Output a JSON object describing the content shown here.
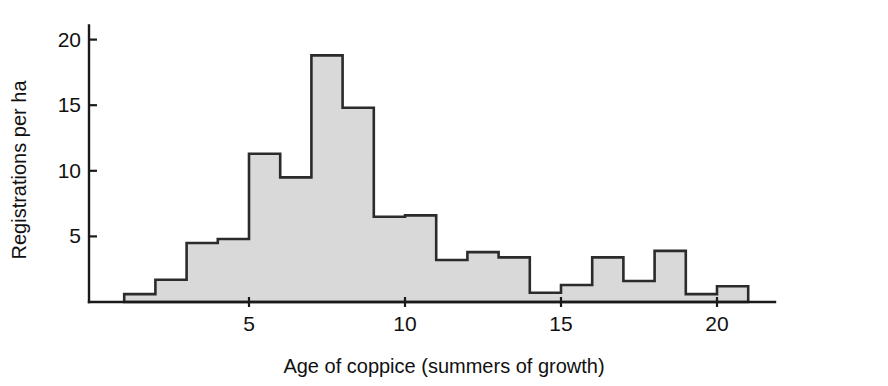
{
  "figure": {
    "background_color": "#ffffff",
    "width": 888,
    "height": 386
  },
  "chart_data": {
    "type": "bar",
    "subtype": "histogram",
    "title": "",
    "subtitle": "",
    "xlabel": "Age of coppice (summers of growth)",
    "ylabel": "Registrations per ha",
    "xlim": [
      0,
      22
    ],
    "ylim": [
      0,
      21
    ],
    "xticks": [
      5,
      10,
      15,
      20
    ],
    "yticks": [
      5,
      10,
      15,
      20
    ],
    "xtick_labels": [
      "5",
      "10",
      "15",
      "20"
    ],
    "ytick_labels": [
      "5",
      "10",
      "15",
      "20"
    ],
    "grid": false,
    "legend": false,
    "legend_position": "none",
    "bin_width": 1,
    "bin_starts": [
      1,
      2,
      3,
      4,
      5,
      6,
      7,
      8,
      9,
      10,
      11,
      12,
      13,
      14,
      15,
      16,
      17,
      18,
      19,
      20
    ],
    "categories": [
      "1-2",
      "2-3",
      "3-4",
      "4-5",
      "5-6",
      "6-7",
      "7-8",
      "8-9",
      "9-10",
      "10-11",
      "11-12",
      "12-13",
      "13-14",
      "14-15",
      "15-16",
      "16-17",
      "17-18",
      "18-19",
      "19-20",
      "20-21"
    ],
    "values": [
      0.6,
      1.7,
      4.5,
      4.8,
      11.3,
      9.5,
      18.8,
      14.8,
      6.5,
      6.6,
      3.2,
      3.8,
      3.4,
      0.7,
      1.3,
      3.4,
      1.6,
      3.9,
      0.6,
      1.2
    ],
    "bar_fill_color": "#d9d9d9",
    "bar_edge_color": "#2b2b2b",
    "axis_color": "#1a1a1a"
  },
  "axes": {
    "x_axis_label": "Age of coppice (summers of growth)",
    "y_axis_label": "Registrations per ha"
  }
}
